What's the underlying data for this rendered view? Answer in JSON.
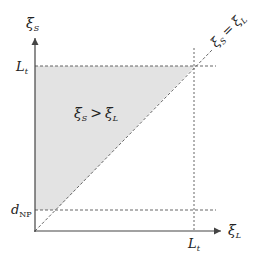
{
  "diagram": {
    "axes": {
      "y_label_main": "ξ",
      "y_label_sub": "S",
      "x_label_main": "ξ",
      "x_label_sub": "L"
    },
    "ticks": {
      "y_top_main": "L",
      "y_top_sub": "t",
      "y_bottom_main": "d",
      "y_bottom_sub": "NP",
      "x_main": "L",
      "x_sub": "t"
    },
    "region_label": {
      "left_main": "ξ",
      "left_sub": "S",
      "op": ">",
      "right_main": "ξ",
      "right_sub": "L"
    },
    "diagonal_label": {
      "left_main": "ξ",
      "left_sub": "S",
      "op": "=",
      "right_main": "ξ",
      "right_sub": "L"
    },
    "colors": {
      "shade": "#e3e3e3",
      "axis": "#444444",
      "dash": "#555555"
    }
  }
}
